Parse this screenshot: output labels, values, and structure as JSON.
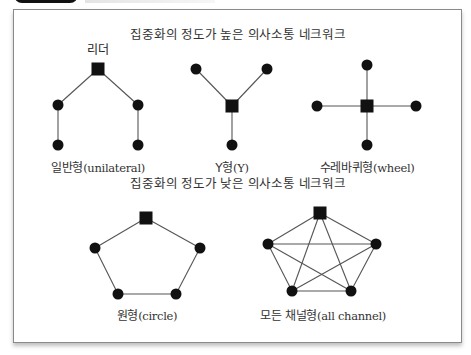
{
  "header": {
    "tab_color": "#111111"
  },
  "sections": [
    {
      "heading": "집중화의 정도가 높은 의사소통 네크워크",
      "heading_pos": [
        238,
        33
      ],
      "networks": [
        {
          "id": "unilateral",
          "label_ko": "일반형",
          "label_en": "(unilateral)",
          "label_pos": [
            98,
            158
          ],
          "annotation": "리더",
          "annotation_pos": [
            98,
            48
          ],
          "hub": [
            98,
            69
          ],
          "nodes": [
            [
              58,
              105
            ],
            [
              138,
              105
            ],
            [
              58,
              145
            ],
            [
              138,
              145
            ]
          ],
          "edges": [
            [
              "hub",
              0
            ],
            [
              "hub",
              1
            ],
            [
              0,
              2
            ],
            [
              1,
              3
            ]
          ]
        },
        {
          "id": "y",
          "label_ko": "Y형",
          "label_en": "(Y)",
          "label_pos": [
            232,
            158
          ],
          "hub": [
            232,
            106
          ],
          "nodes": [
            [
              196,
              69
            ],
            [
              267,
              69
            ],
            [
              232,
              145
            ]
          ],
          "edges": [
            [
              "hub",
              0
            ],
            [
              "hub",
              1
            ],
            [
              "hub",
              2
            ]
          ]
        },
        {
          "id": "wheel",
          "label_ko": "수레바퀴형",
          "label_en": "(wheel)",
          "label_pos": [
            367,
            158
          ],
          "hub": [
            367,
            106
          ],
          "nodes": [
            [
              367,
              65
            ],
            [
              317,
              106
            ],
            [
              416,
              106
            ],
            [
              367,
              145
            ]
          ],
          "edges": [
            [
              "hub",
              0
            ],
            [
              "hub",
              1
            ],
            [
              "hub",
              2
            ],
            [
              "hub",
              3
            ]
          ]
        }
      ]
    },
    {
      "heading": "집중화의 정도가 낮은 의사소통 네크워크",
      "heading_pos": [
        238,
        182
      ],
      "networks": [
        {
          "id": "circle",
          "label_ko": "원형",
          "label_en": "(circle)",
          "label_pos": [
            147,
            306
          ],
          "hub": [
            146,
            218
          ],
          "nodes": [
            [
              95,
              248
            ],
            [
              200,
              248
            ],
            [
              118,
              294
            ],
            [
              176,
              294
            ]
          ],
          "edges": [
            [
              "hub",
              0
            ],
            [
              "hub",
              1
            ],
            [
              0,
              2
            ],
            [
              1,
              3
            ],
            [
              2,
              3
            ]
          ]
        },
        {
          "id": "all-channel",
          "label_ko": "모든 채널형",
          "label_en": "(all channel)",
          "label_pos": [
            323,
            306
          ],
          "hub": [
            320,
            213
          ],
          "nodes": [
            [
              268,
              244
            ],
            [
              376,
              244
            ],
            [
              292,
              291
            ],
            [
              351,
              291
            ]
          ],
          "edges": [
            [
              "hub",
              0
            ],
            [
              "hub",
              1
            ],
            [
              "hub",
              2
            ],
            [
              "hub",
              3
            ],
            [
              0,
              1
            ],
            [
              0,
              2
            ],
            [
              0,
              3
            ],
            [
              1,
              2
            ],
            [
              1,
              3
            ],
            [
              2,
              3
            ]
          ]
        }
      ]
    }
  ],
  "style": {
    "node_color": "#111111",
    "edge_color": "#555555",
    "frame_border": "#8a8a8a"
  }
}
